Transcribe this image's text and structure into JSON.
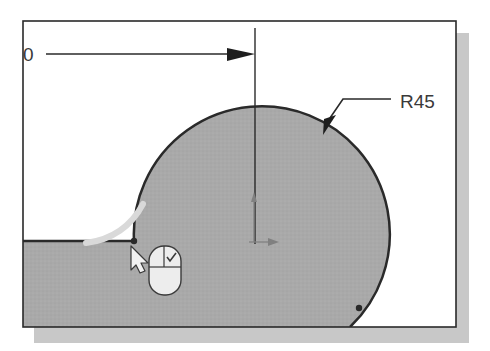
{
  "diagram": {
    "type": "cad-sketch",
    "dimensions": {
      "horizontal": {
        "label": "0"
      },
      "radius": {
        "label": "R45"
      }
    },
    "colors": {
      "fill": "#a9a9a9",
      "line": "#2a2a2a",
      "shadow": "#c8c8c8",
      "highlight": "#d9d9d9",
      "background": "#ffffff"
    },
    "cursor": {
      "type": "pointer-with-mouse",
      "action": "left-click-check"
    }
  }
}
